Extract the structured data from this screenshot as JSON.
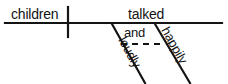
{
  "diagram": {
    "type": "reed-kellogg-sentence-diagram",
    "sentence": "children talked loudly and happily",
    "baseline": {
      "x1": 5,
      "y1": 23,
      "x2": 222,
      "y2": 23,
      "stroke_width": 2.2,
      "color": "#141414"
    },
    "subject_verb_divider": {
      "x": 68,
      "y1": 7,
      "y2": 37,
      "stroke_width": 2.2,
      "color": "#141414"
    },
    "subject": {
      "label": "children",
      "x": 11,
      "y": 19
    },
    "verb": {
      "label": "talked",
      "x": 128,
      "y": 19
    },
    "conjunction": {
      "label": "and",
      "x": 124,
      "y": 37
    },
    "conjunction_connector": {
      "x1": 121,
      "y1": 44,
      "x2": 161,
      "y2": 44,
      "stroke_width": 2.0,
      "dash": "6,5",
      "color": "#141414"
    },
    "modifiers": [
      {
        "label": "loudly",
        "line": {
          "x1": 112,
          "y1": 24,
          "x2": 145,
          "y2": 83
        },
        "text_x": 118,
        "text_y": 40,
        "rotation": 61,
        "stroke_width": 2.2,
        "color": "#141414"
      },
      {
        "label": "happily",
        "line": {
          "x1": 155,
          "y1": 24,
          "x2": 190,
          "y2": 83
        },
        "text_x": 161,
        "text_y": 30,
        "rotation": 61,
        "stroke_width": 2.2,
        "color": "#141414"
      }
    ],
    "colors": {
      "ink": "#141414",
      "background": "#ffffff"
    }
  }
}
